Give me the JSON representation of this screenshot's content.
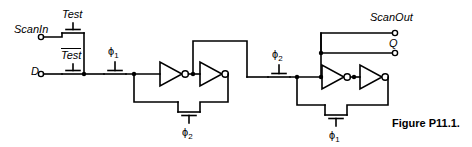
{
  "figure": {
    "caption": "Figure P11.1.",
    "width": 472,
    "height": 147,
    "line_color": "#000000",
    "background_color": "#ffffff"
  },
  "labels": {
    "scan_in": "ScanIn",
    "test": "Test",
    "test_bar": "Test",
    "data_in": "D",
    "phi1_a": "ϕ",
    "phi1_a_sub": "1",
    "phi2_a": "ϕ",
    "phi2_a_sub": "2",
    "phi2_b": "ϕ",
    "phi2_b_sub": "2",
    "phi1_b": "ϕ",
    "phi1_b_sub": "1",
    "scan_out": "ScanOut",
    "q_out": "Q"
  },
  "terminals": [
    {
      "name": "scan-in-terminal",
      "label": "ScanIn"
    },
    {
      "name": "data-in-terminal",
      "label": "D"
    },
    {
      "name": "scan-out-terminal",
      "label": "ScanOut"
    },
    {
      "name": "q-out-terminal",
      "label": "Q"
    }
  ],
  "transistors": [
    {
      "name": "test-pass-transistor",
      "gate": "Test"
    },
    {
      "name": "test-bar-pass-transistor",
      "gate": "Test"
    },
    {
      "name": "phi1-input-pass-transistor",
      "gate": "ϕ1"
    },
    {
      "name": "phi2-feedback-pass-transistor",
      "gate": "ϕ2"
    },
    {
      "name": "phi2-stage2-pass-transistor",
      "gate": "ϕ2"
    },
    {
      "name": "phi1-feedback-pass-transistor",
      "gate": "ϕ1"
    }
  ],
  "inverters": [
    {
      "name": "inverter-1-stage1"
    },
    {
      "name": "inverter-2-stage1"
    },
    {
      "name": "inverter-1-stage2"
    },
    {
      "name": "inverter-2-stage2"
    }
  ]
}
